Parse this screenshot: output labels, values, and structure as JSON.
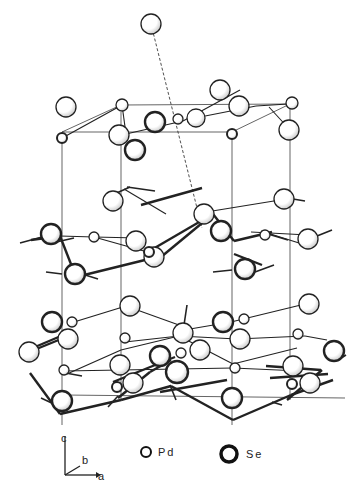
{
  "diagram": {
    "type": "crystal-structure",
    "colors": {
      "line": "#222222",
      "fill": "#ffffff",
      "shade": "#bbbbbb"
    },
    "cell_lines": [
      [
        62,
        132,
        62,
        425
      ],
      [
        121,
        112,
        121,
        400
      ],
      [
        232,
        132,
        232,
        425
      ],
      [
        290,
        104,
        290,
        400
      ],
      [
        62,
        132,
        232,
        132
      ],
      [
        121,
        105,
        290,
        104
      ],
      [
        62,
        132,
        121,
        105
      ],
      [
        232,
        132,
        290,
        104
      ],
      [
        64,
        395,
        345,
        398
      ]
    ],
    "dashed_lines": [
      [
        151,
        24,
        202,
        228
      ]
    ],
    "bonds_thin": [
      [
        64,
        137,
        122,
        105
      ],
      [
        122,
        105,
        126,
        134
      ],
      [
        195,
        118,
        256,
        106
      ],
      [
        256,
        106,
        288,
        104
      ],
      [
        240,
        90,
        183,
        121
      ],
      [
        269,
        107,
        291,
        131
      ],
      [
        126,
        134,
        183,
        121
      ],
      [
        124,
        189,
        166,
        214
      ],
      [
        200,
        213,
        280,
        200
      ],
      [
        60,
        236,
        94,
        237
      ],
      [
        94,
        237,
        151,
        253
      ],
      [
        94,
        237,
        138,
        238
      ],
      [
        251,
        232,
        308,
        235
      ],
      [
        261,
        231,
        299,
        243
      ],
      [
        126,
        306,
        74,
        322
      ],
      [
        126,
        306,
        190,
        329
      ],
      [
        190,
        329,
        231,
        322
      ],
      [
        231,
        322,
        305,
        304
      ],
      [
        179,
        336,
        125,
        342
      ],
      [
        179,
        336,
        237,
        339
      ],
      [
        237,
        339,
        305,
        336
      ],
      [
        305,
        336,
        327,
        340
      ],
      [
        67,
        374,
        121,
        350
      ],
      [
        121,
        350,
        179,
        336
      ],
      [
        179,
        336,
        233,
        364
      ],
      [
        233,
        364,
        297,
        348
      ],
      [
        64,
        371,
        121,
        370
      ],
      [
        121,
        370,
        233,
        368
      ],
      [
        233,
        368,
        300,
        371
      ]
    ],
    "bonds_thick": [
      [
        31,
        240,
        60,
        236
      ],
      [
        60,
        236,
        76,
        277
      ],
      [
        76,
        277,
        149,
        259
      ],
      [
        141,
        205,
        202,
        188
      ],
      [
        146,
        253,
        213,
        214
      ],
      [
        161,
        257,
        213,
        214
      ],
      [
        213,
        214,
        234,
        241
      ],
      [
        234,
        241,
        272,
        232
      ],
      [
        234,
        254,
        262,
        265
      ],
      [
        30,
        373,
        60,
        414
      ],
      [
        60,
        414,
        121,
        400
      ],
      [
        121,
        400,
        171,
        386
      ],
      [
        171,
        386,
        233,
        420
      ],
      [
        233,
        420,
        291,
        395
      ],
      [
        291,
        395,
        333,
        380
      ],
      [
        113,
        382,
        175,
        357
      ],
      [
        160,
        392,
        227,
        380
      ],
      [
        35,
        347,
        68,
        333
      ],
      [
        34,
        350,
        66,
        337
      ],
      [
        266,
        366,
        321,
        370
      ],
      [
        270,
        378,
        328,
        374
      ],
      [
        118,
        398,
        150,
        372
      ],
      [
        150,
        372,
        171,
        360
      ],
      [
        287,
        400,
        322,
        370
      ]
    ],
    "stubs": [
      [
        130,
        187,
        110,
        196
      ],
      [
        127,
        187,
        155,
        191
      ],
      [
        287,
        198,
        305,
        201
      ],
      [
        20,
        243,
        42,
        237
      ],
      [
        52,
        243,
        74,
        238
      ],
      [
        62,
        274,
        46,
        272
      ],
      [
        82,
        274,
        98,
        279
      ],
      [
        213,
        272,
        232,
        270
      ],
      [
        255,
        272,
        274,
        265
      ],
      [
        317,
        236,
        332,
        230
      ],
      [
        268,
        234,
        288,
        240
      ],
      [
        184,
        325,
        187,
        305
      ],
      [
        346,
        355,
        338,
        360
      ],
      [
        82,
        376,
        60,
        372
      ],
      [
        170,
        385,
        176,
        400
      ],
      [
        56,
        405,
        41,
        398
      ],
      [
        108,
        407,
        118,
        396
      ],
      [
        282,
        405,
        272,
        402
      ]
    ],
    "atoms": [
      {
        "el": "Se",
        "x": 151,
        "y": 24,
        "r": 10,
        "w": 1.3
      },
      {
        "el": "Se",
        "x": 66,
        "y": 107,
        "r": 10,
        "w": 1.3
      },
      {
        "el": "Pd",
        "x": 122,
        "y": 105,
        "r": 6,
        "w": 1.3
      },
      {
        "el": "Se",
        "x": 220,
        "y": 90,
        "r": 10,
        "w": 1.3
      },
      {
        "el": "Se",
        "x": 239,
        "y": 106,
        "r": 10,
        "w": 1.3
      },
      {
        "el": "Pd",
        "x": 292,
        "y": 103,
        "r": 6,
        "w": 1.3
      },
      {
        "el": "Se",
        "x": 196,
        "y": 118,
        "r": 9,
        "w": 1.3
      },
      {
        "el": "Pd",
        "x": 178,
        "y": 119,
        "r": 5,
        "w": 1.3
      },
      {
        "el": "Se",
        "x": 155,
        "y": 122,
        "r": 10,
        "w": 2.4
      },
      {
        "el": "Se",
        "x": 119,
        "y": 135,
        "r": 10,
        "w": 1.3
      },
      {
        "el": "Pd",
        "x": 62,
        "y": 138,
        "r": 5,
        "w": 2
      },
      {
        "el": "Pd",
        "x": 232,
        "y": 134,
        "r": 5,
        "w": 2
      },
      {
        "el": "Se",
        "x": 289,
        "y": 130,
        "r": 10,
        "w": 1.3
      },
      {
        "el": "Se",
        "x": 135,
        "y": 150,
        "r": 10,
        "w": 2.4
      },
      {
        "el": "Se",
        "x": 113,
        "y": 201,
        "r": 10,
        "w": 1.3
      },
      {
        "el": "Se",
        "x": 284,
        "y": 199,
        "r": 10,
        "w": 1.3
      },
      {
        "el": "Se",
        "x": 204,
        "y": 214,
        "r": 10,
        "w": 1.3
      },
      {
        "el": "Se",
        "x": 51,
        "y": 234,
        "r": 10,
        "w": 2.4
      },
      {
        "el": "Pd",
        "x": 94,
        "y": 237,
        "r": 5,
        "w": 1.3
      },
      {
        "el": "Se",
        "x": 136,
        "y": 241,
        "r": 10,
        "w": 1.3
      },
      {
        "el": "Se",
        "x": 221,
        "y": 231,
        "r": 10,
        "w": 2.4
      },
      {
        "el": "Pd",
        "x": 265,
        "y": 235,
        "r": 5,
        "w": 1.3
      },
      {
        "el": "Se",
        "x": 308,
        "y": 239,
        "r": 10,
        "w": 1.3
      },
      {
        "el": "Se",
        "x": 154,
        "y": 257,
        "r": 10,
        "w": 1.3
      },
      {
        "el": "Pd",
        "x": 149,
        "y": 252,
        "r": 5,
        "w": 2
      },
      {
        "el": "Se",
        "x": 75,
        "y": 274,
        "r": 10,
        "w": 2.4
      },
      {
        "el": "Se",
        "x": 245,
        "y": 269,
        "r": 10,
        "w": 2.4
      },
      {
        "el": "Se",
        "x": 130,
        "y": 306,
        "r": 10,
        "w": 1.3
      },
      {
        "el": "Se",
        "x": 309,
        "y": 304,
        "r": 10,
        "w": 1.3
      },
      {
        "el": "Se",
        "x": 52,
        "y": 322,
        "r": 10,
        "w": 2.4
      },
      {
        "el": "Pd",
        "x": 72,
        "y": 322,
        "r": 5,
        "w": 1.3
      },
      {
        "el": "Se",
        "x": 223,
        "y": 322,
        "r": 10,
        "w": 2.4
      },
      {
        "el": "Pd",
        "x": 244,
        "y": 319,
        "r": 5,
        "w": 1.3
      },
      {
        "el": "Se",
        "x": 183,
        "y": 333,
        "r": 10,
        "w": 1.3
      },
      {
        "el": "Se",
        "x": 68,
        "y": 339,
        "r": 10,
        "w": 1.3
      },
      {
        "el": "Se",
        "x": 240,
        "y": 339,
        "r": 10,
        "w": 1.3
      },
      {
        "el": "Pd",
        "x": 125,
        "y": 338,
        "r": 5,
        "w": 1.3
      },
      {
        "el": "Pd",
        "x": 298,
        "y": 334,
        "r": 5,
        "w": 1.3
      },
      {
        "el": "Se",
        "x": 29,
        "y": 352,
        "r": 10,
        "w": 1.3
      },
      {
        "el": "Se",
        "x": 160,
        "y": 356,
        "r": 10,
        "w": 2.4
      },
      {
        "el": "Se",
        "x": 200,
        "y": 350,
        "r": 10,
        "w": 1.3
      },
      {
        "el": "Se",
        "x": 334,
        "y": 351,
        "r": 10,
        "w": 2.4
      },
      {
        "el": "Pd",
        "x": 181,
        "y": 353,
        "r": 5,
        "w": 1.3
      },
      {
        "el": "Se",
        "x": 120,
        "y": 365,
        "r": 10,
        "w": 1.3
      },
      {
        "el": "Se",
        "x": 177,
        "y": 372,
        "r": 11,
        "w": 2.4
      },
      {
        "el": "Se",
        "x": 293,
        "y": 366,
        "r": 10,
        "w": 1.3
      },
      {
        "el": "Pd",
        "x": 64,
        "y": 370,
        "r": 5,
        "w": 1.3
      },
      {
        "el": "Pd",
        "x": 235,
        "y": 368,
        "r": 5,
        "w": 1.3
      },
      {
        "el": "Se",
        "x": 133,
        "y": 383,
        "r": 10,
        "w": 1.3
      },
      {
        "el": "Se",
        "x": 310,
        "y": 383,
        "r": 10,
        "w": 1.3
      },
      {
        "el": "Pd",
        "x": 117,
        "y": 387,
        "r": 5,
        "w": 2
      },
      {
        "el": "Pd",
        "x": 292,
        "y": 384,
        "r": 5,
        "w": 2
      },
      {
        "el": "Se",
        "x": 62,
        "y": 401,
        "r": 10,
        "w": 2.4
      },
      {
        "el": "Se",
        "x": 232,
        "y": 398,
        "r": 10,
        "w": 2.4
      }
    ]
  },
  "legend": {
    "axes": {
      "c": "c",
      "b": "b",
      "a": "a"
    },
    "items": [
      {
        "label": "Pd",
        "symbol": "small-thin-circle"
      },
      {
        "label": "Se",
        "symbol": "large-thick-circle"
      }
    ]
  }
}
